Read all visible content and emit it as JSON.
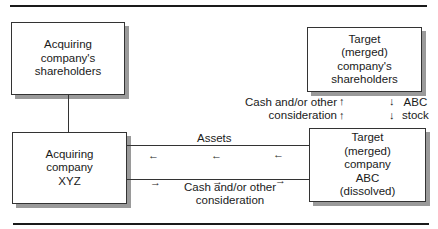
{
  "boxes": {
    "acquirer_shareholders": "Acquiring\ncompany's\nshareholders",
    "acquirer": "Acquiring\ncompany\nXYZ",
    "target_shareholders": "Target\n(merged)\ncompany's\nshareholders",
    "target": "Target\n(merged)\ncompany\nABC\n(dissolved)"
  },
  "flows": {
    "assets": "Assets",
    "cash_to_target": "Cash and/or other\nconsideration",
    "cash_to_shareholders": "Cash and/or other\nconsideration",
    "stock": "ABC\nstock"
  },
  "arrows": {
    "left": "←",
    "right": "→",
    "up": "↑",
    "down": "↓"
  }
}
